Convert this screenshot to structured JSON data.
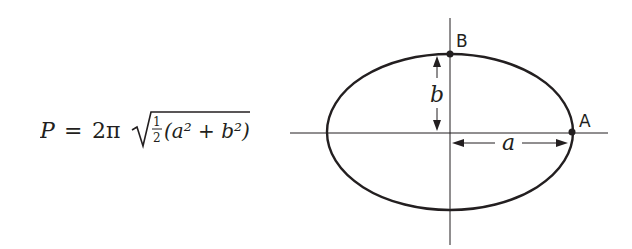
{
  "formula": {
    "lhs": "P",
    "equals": "=",
    "coefficient": "2π",
    "fraction_num": "1",
    "fraction_den": "2",
    "inner": "(a² + b²)"
  },
  "diagram": {
    "point_a_label": "A",
    "point_b_label": "B",
    "semi_major_label": "a",
    "semi_minor_label": "b"
  },
  "colors": {
    "ink": "#231f20",
    "background": "#ffffff"
  }
}
